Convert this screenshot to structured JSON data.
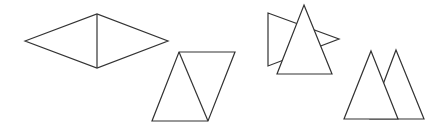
{
  "figure": {
    "stroke_color": "#333333",
    "background": "#ffffff",
    "shapes": [
      {
        "id": "rhombus-split",
        "kind": "two triangles forming a rhombus",
        "outline": "25,41 97,14 168,41 97,68",
        "inner_line": {
          "x1": 97,
          "y1": 14,
          "x2": 97,
          "y2": 68
        }
      },
      {
        "id": "parallelogram-split",
        "kind": "two triangles forming a parallelogram",
        "outline": "179,52 235,52 208,121 152,121",
        "inner_line": {
          "x1": 179,
          "y1": 52,
          "x2": 208,
          "y2": 121
        }
      },
      {
        "id": "overlapping-triangles",
        "kind": "triangle overlapping a rotated triangle",
        "back_triangle": "268,13 339,39 268,66",
        "front_triangle": "304,5 332,74 277,74"
      },
      {
        "id": "adjacent-peaks",
        "kind": "two overlapping upright triangles",
        "back_triangle": "396,50 424,119 370,119",
        "front_triangle": "371,51 398,119 344,119"
      }
    ]
  }
}
